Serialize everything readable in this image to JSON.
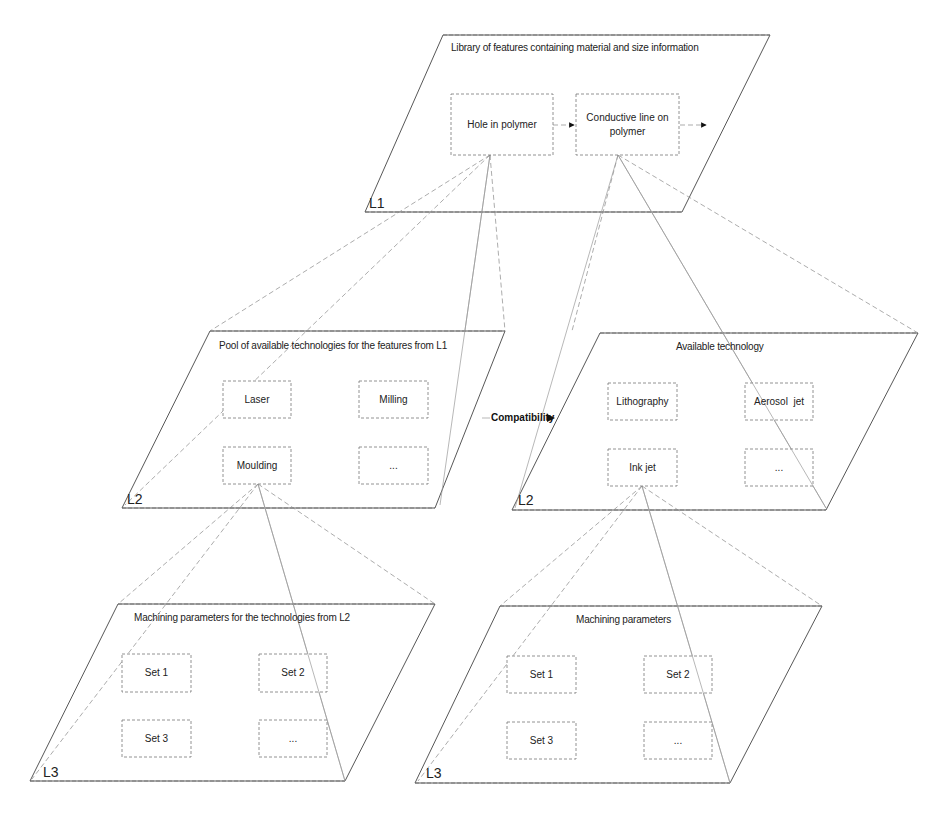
{
  "diagram": {
    "l1": {
      "tag": "L1",
      "title": "Library of features containing material and size information",
      "features": [
        "Hole in polymer",
        "Conductive line on polymer"
      ]
    },
    "l2_left": {
      "tag": "L2",
      "title": "Pool of available technologies for  the features from L1",
      "items": [
        "Laser",
        "Milling",
        "Moulding",
        "..."
      ]
    },
    "l2_right": {
      "tag": "L2",
      "title": "Available technology",
      "items": [
        "Lithography",
        "Aerosol  jet",
        "Ink jet",
        "..."
      ]
    },
    "compatibility_label": "Compatibility",
    "l3_left": {
      "tag": "L3",
      "title": "Machining parameters for the technologies from L2",
      "items": [
        "Set 1",
        "Set 2",
        "Set 3",
        "..."
      ]
    },
    "l3_right": {
      "tag": "L3",
      "title": "Machining parameters",
      "items": [
        "Set 1",
        "Set 2",
        "Set 3",
        "..."
      ]
    }
  }
}
